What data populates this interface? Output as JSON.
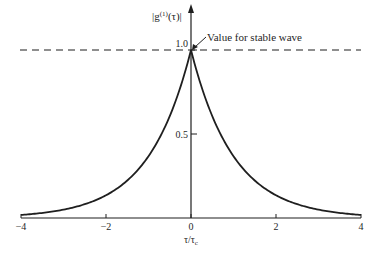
{
  "chart_data": {
    "type": "line",
    "title": "",
    "xlabel": "τ/τc",
    "ylabel": "|g(1)(τ)|",
    "ylabel_parts": {
      "base": "|g",
      "sup": "(1)",
      "rest": "(τ)|"
    },
    "xlabel_parts": {
      "base": "τ/τ",
      "sub": "c"
    },
    "xlim": [
      -4,
      4
    ],
    "ylim": [
      0,
      1.0
    ],
    "x_ticks": [
      -4,
      -2,
      0,
      2,
      4
    ],
    "x_tick_labels": [
      "−4",
      "−2",
      "0",
      "2",
      "4"
    ],
    "y_ticks": [
      0.5,
      1.0
    ],
    "y_tick_labels": [
      "0.5",
      "1.0"
    ],
    "grid": false,
    "legend": null,
    "series": [
      {
        "name": "|g(1)(τ)| = exp(−|τ|/τc)",
        "x": [
          -4,
          -3.5,
          -3,
          -2.5,
          -2,
          -1.5,
          -1,
          -0.5,
          0,
          0.5,
          1,
          1.5,
          2,
          2.5,
          3,
          3.5,
          4
        ],
        "y": [
          0.018,
          0.03,
          0.05,
          0.082,
          0.135,
          0.223,
          0.368,
          0.607,
          1.0,
          0.607,
          0.368,
          0.223,
          0.135,
          0.082,
          0.05,
          0.03,
          0.018
        ]
      }
    ],
    "reference_lines": [
      {
        "type": "horizontal",
        "y": 1.0,
        "style": "dashed",
        "label": "Value for stable wave"
      }
    ],
    "annotations": [
      {
        "text": "Value for stable wave",
        "points_to": [
          0,
          1.0
        ]
      }
    ]
  },
  "colors": {
    "ink": "#1f1f1f",
    "background": "#ffffff"
  }
}
